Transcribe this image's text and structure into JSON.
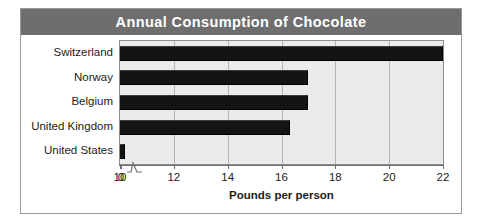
{
  "chart_data": {
    "type": "bar",
    "orientation": "horizontal",
    "title": "Annual Consumption of Chocolate",
    "xlabel": "Pounds per person",
    "ylabel": "",
    "categories": [
      "Switzerland",
      "Norway",
      "Belgium",
      "United Kingdom",
      "United States"
    ],
    "values": [
      22.0,
      17.0,
      17.0,
      16.3,
      10.2
    ],
    "series": [
      {
        "name": "Pounds per person",
        "values": [
          22.0,
          17.0,
          17.0,
          16.3,
          10.2
        ]
      }
    ],
    "xlim": [
      10,
      22
    ],
    "axis_break": true,
    "axis_break_note": "Axis broken between 0 and 10",
    "xticks": [
      "0",
      "10",
      "12",
      "14",
      "16",
      "18",
      "20",
      "22"
    ],
    "xtick_values": [
      0,
      10,
      12,
      14,
      16,
      18,
      20,
      22
    ],
    "grid": true,
    "grid_axis": "x",
    "legend": false,
    "legend_position": "none",
    "colors": {
      "bar": "#141414",
      "plot_background": "#ebebeb",
      "title_bar": "#6e6e6e",
      "title_text": "#ffffff",
      "gridline": "#b4b4b4",
      "axis": "#6e6e6e",
      "frame": "#9a9a9a",
      "text": "#1c1c1c"
    }
  },
  "icons": {
    "axis_break": "axis-break-zigzag-icon"
  }
}
